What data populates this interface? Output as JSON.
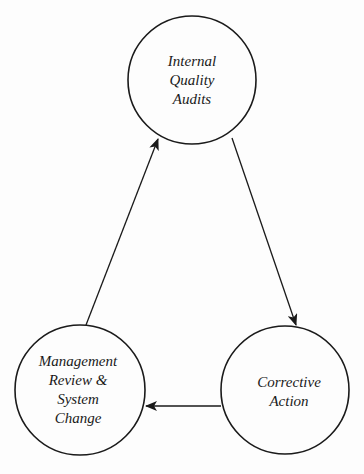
{
  "diagram": {
    "type": "cycle",
    "colors": {
      "stroke": "#1a1a1a",
      "background": "#fdfdfd",
      "text": "#1a1a1a"
    },
    "nodes": [
      {
        "id": "audits",
        "lines": [
          "Internal",
          "Quality",
          "Audits"
        ],
        "cx": 192,
        "cy": 80,
        "r": 64
      },
      {
        "id": "corrective",
        "lines": [
          "Corrective",
          "Action"
        ],
        "cx": 285,
        "cy": 390,
        "r": 64
      },
      {
        "id": "review",
        "lines": [
          "Management",
          "Review &",
          "System",
          "Change"
        ],
        "cx": 80,
        "cy": 390,
        "r": 65
      }
    ],
    "edges": [
      {
        "from": "audits",
        "to": "corrective"
      },
      {
        "from": "corrective",
        "to": "review"
      },
      {
        "from": "review",
        "to": "audits"
      }
    ]
  }
}
